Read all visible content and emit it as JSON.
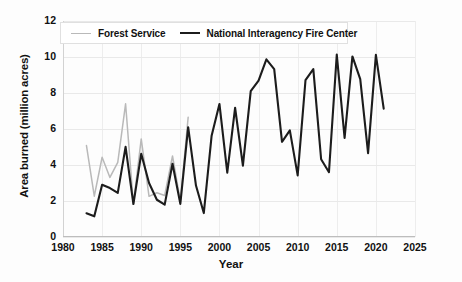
{
  "chart_data": {
    "type": "line",
    "title": "",
    "xlabel": "Year",
    "ylabel": "Area burned (million acres)",
    "xlim": [
      1980,
      2025
    ],
    "ylim": [
      0,
      12
    ],
    "xticks": [
      1980,
      1985,
      1990,
      1995,
      2000,
      2005,
      2010,
      2015,
      2020,
      2025
    ],
    "yticks": [
      0,
      2,
      4,
      6,
      8,
      10,
      12
    ],
    "grid": true,
    "legend_position": "top-left",
    "series": [
      {
        "name": "Forest Service",
        "color": "#b9b9b9",
        "x": [
          1983,
          1984,
          1985,
          1986,
          1987,
          1988,
          1989,
          1990,
          1991,
          1992,
          1993,
          1994,
          1995,
          1996
        ],
        "values": [
          5.08,
          2.27,
          4.43,
          3.31,
          4.15,
          7.4,
          1.83,
          5.45,
          2.26,
          2.46,
          2.31,
          4.5,
          2.0,
          6.65
        ]
      },
      {
        "name": "National Interagency Fire Center",
        "color": "#1c1c1c",
        "x": [
          1983,
          1984,
          1985,
          1986,
          1987,
          1988,
          1989,
          1990,
          1991,
          1992,
          1993,
          1994,
          1995,
          1996,
          1997,
          1998,
          1999,
          2000,
          2001,
          2002,
          2003,
          2004,
          2005,
          2006,
          2007,
          2008,
          2009,
          2010,
          2011,
          2012,
          2013,
          2014,
          2015,
          2016,
          2017,
          2018,
          2019,
          2020,
          2021
        ],
        "values": [
          1.32,
          1.15,
          2.9,
          2.72,
          2.45,
          5.01,
          1.83,
          4.62,
          3.0,
          2.07,
          1.8,
          4.07,
          1.84,
          6.1,
          2.86,
          1.33,
          5.63,
          7.39,
          3.57,
          7.18,
          3.96,
          8.1,
          8.69,
          9.87,
          9.33,
          5.29,
          5.92,
          3.42,
          8.71,
          9.33,
          4.32,
          3.6,
          10.13,
          5.5,
          10.03,
          8.77,
          4.66,
          10.12,
          7.13
        ]
      }
    ]
  },
  "legend": {
    "entries": [
      {
        "label": "Forest Service"
      },
      {
        "label": "National Interagency Fire Center"
      }
    ]
  },
  "axes": {
    "x_title": "Year",
    "y_title": "Area burned (million acres)"
  }
}
